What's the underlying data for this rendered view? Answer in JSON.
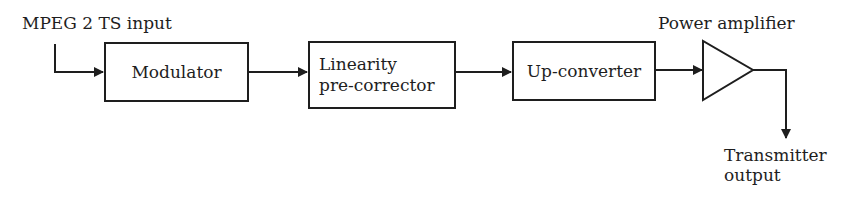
{
  "diagram": {
    "type": "block-diagram",
    "direction": "left-to-right",
    "input_label": "MPEG 2 TS input",
    "blocks": [
      {
        "id": "modulator",
        "label": "Modulator"
      },
      {
        "id": "linearity",
        "label_line1": "Linearity",
        "label_line2": "pre-corrector"
      },
      {
        "id": "upconverter",
        "label": "Up-converter"
      }
    ],
    "amplifier": {
      "label": "Power amplifier",
      "shape": "triangle-icon"
    },
    "output_label_line1": "Transmitter",
    "output_label_line2": "output",
    "connections": [
      {
        "from": "MPEG 2 TS input",
        "to": "Modulator"
      },
      {
        "from": "Modulator",
        "to": "Linearity pre-corrector"
      },
      {
        "from": "Linearity pre-corrector",
        "to": "Up-converter"
      },
      {
        "from": "Up-converter",
        "to": "Power amplifier"
      },
      {
        "from": "Power amplifier",
        "to": "Transmitter output"
      }
    ],
    "colors": {
      "stroke": "#1e1e1e",
      "background": "#ffffff"
    }
  }
}
